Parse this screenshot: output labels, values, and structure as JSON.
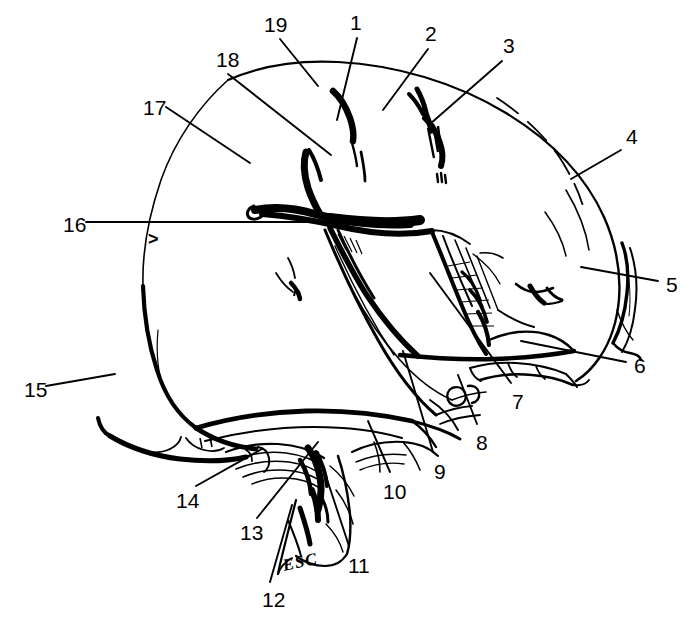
{
  "figure": {
    "type": "anatomical-line-drawing",
    "view": "lateral",
    "ink_color": "#000000",
    "background_color": "#ffffff",
    "width": 686,
    "height": 617
  },
  "signature": {
    "text": "ESC",
    "x": 283,
    "y": 556
  },
  "markers": [
    {
      "name": "caret-marker",
      "glyph": ">",
      "x": 148,
      "y": 230
    }
  ],
  "labels": [
    {
      "id": "1",
      "text": "1",
      "tx": 350,
      "ty": 12,
      "lx": 357,
      "ly": 38,
      "ex": 337,
      "ey": 120
    },
    {
      "id": "2",
      "text": "2",
      "tx": 425,
      "ty": 23,
      "lx": 428,
      "ly": 49,
      "ex": 383,
      "ey": 110
    },
    {
      "id": "3",
      "text": "3",
      "tx": 503,
      "ty": 35,
      "lx": 502,
      "ly": 61,
      "ex": 430,
      "ey": 124
    },
    {
      "id": "4",
      "text": "4",
      "tx": 626,
      "ty": 126,
      "lx": 621,
      "ly": 150,
      "ex": 571,
      "ey": 179
    },
    {
      "id": "5",
      "text": "5",
      "tx": 666,
      "ty": 274,
      "lx": 658,
      "ly": 281,
      "ex": 581,
      "ey": 267
    },
    {
      "id": "6",
      "text": "6",
      "tx": 634,
      "ty": 355,
      "lx": 626,
      "ly": 362,
      "ex": 521,
      "ey": 341
    },
    {
      "id": "7",
      "text": "7",
      "tx": 512,
      "ty": 391,
      "lx": 511,
      "ly": 383,
      "ex": 430,
      "ey": 273
    },
    {
      "id": "8",
      "text": "8",
      "tx": 476,
      "ty": 432,
      "lx": 477,
      "ly": 424,
      "ex": 458,
      "ey": 375
    },
    {
      "id": "9",
      "text": "9",
      "tx": 434,
      "ty": 461,
      "lx": 433,
      "ly": 452,
      "ex": 403,
      "ey": 351
    },
    {
      "id": "10",
      "text": "10",
      "tx": 383,
      "ty": 481,
      "lx": 390,
      "ly": 472,
      "ex": 368,
      "ey": 421
    },
    {
      "id": "11",
      "text": "11",
      "tx": 348,
      "ty": 555,
      "lx": 349,
      "ly": 546,
      "ex": 318,
      "ey": 452
    },
    {
      "id": "12",
      "text": "12",
      "tx": 262,
      "ty": 589,
      "lx": 270,
      "ly": 582,
      "ex": 292,
      "ey": 505
    },
    {
      "id": "13",
      "text": "13",
      "tx": 240,
      "ty": 522,
      "lx": 257,
      "ly": 518,
      "ex": 318,
      "ey": 442
    },
    {
      "id": "14",
      "text": "14",
      "tx": 176,
      "ty": 490,
      "lx": 196,
      "ly": 486,
      "ex": 262,
      "ey": 449
    },
    {
      "id": "15",
      "text": "15",
      "tx": 24,
      "ty": 379,
      "lx": 46,
      "ly": 386,
      "ex": 115,
      "ey": 374
    },
    {
      "id": "16",
      "text": "16",
      "tx": 63,
      "ty": 214,
      "lx": 86,
      "ly": 222,
      "ex": 330,
      "ey": 222
    },
    {
      "id": "17",
      "text": "17",
      "tx": 143,
      "ty": 97,
      "lx": 166,
      "ly": 107,
      "ex": 250,
      "ey": 163
    },
    {
      "id": "18",
      "text": "18",
      "tx": 216,
      "ty": 49,
      "lx": 228,
      "ly": 74,
      "ex": 331,
      "ey": 155
    },
    {
      "id": "19",
      "text": "19",
      "tx": 264,
      "ty": 14,
      "lx": 280,
      "ly": 39,
      "ex": 318,
      "ey": 86
    }
  ]
}
